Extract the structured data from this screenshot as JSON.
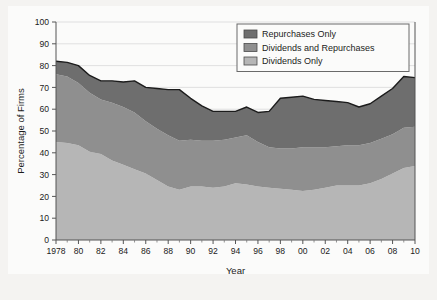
{
  "figure": {
    "background_color": "#fbfbfa",
    "page_background_color": "#f4f3f1"
  },
  "chart_data": {
    "type": "area",
    "stacked": true,
    "title": "",
    "xlabel": "Year",
    "ylabel": "Percentage of Firms",
    "xlim": [
      1978,
      2010
    ],
    "ylim": [
      0,
      100
    ],
    "ytick_step": 10,
    "xtick_step": 2,
    "grid": "horizontal",
    "legend_position": "top-right",
    "yticks": [
      "0",
      "10",
      "20",
      "30",
      "40",
      "50",
      "60",
      "70",
      "80",
      "90",
      "100"
    ],
    "xticks": [
      "1978",
      "80",
      "82",
      "84",
      "86",
      "88",
      "90",
      "92",
      "94",
      "96",
      "98",
      "00",
      "02",
      "04",
      "06",
      "08",
      "10"
    ],
    "x": [
      1978,
      1979,
      1980,
      1981,
      1982,
      1983,
      1984,
      1985,
      1986,
      1987,
      1988,
      1989,
      1990,
      1991,
      1992,
      1993,
      1994,
      1995,
      1996,
      1997,
      1998,
      1999,
      2000,
      2001,
      2002,
      2003,
      2004,
      2005,
      2006,
      2007,
      2008,
      2009,
      2010
    ],
    "series": [
      {
        "name": "Dividends Only",
        "color": "#b6b6b6",
        "values": [
          45.0,
          44.5,
          43.5,
          40.5,
          39.5,
          36.5,
          34.5,
          32.5,
          30.5,
          27.5,
          24.5,
          23.0,
          24.5,
          24.5,
          24.0,
          24.5,
          26.0,
          25.5,
          24.5,
          24.0,
          23.5,
          23.0,
          22.5,
          23.0,
          24.0,
          25.0,
          25.0,
          25.0,
          26.0,
          28.0,
          30.5,
          33.0,
          34.0
        ]
      },
      {
        "name": "Dividends and Repurchases",
        "color": "#8f8f8f",
        "values": [
          31.0,
          30.5,
          28.5,
          27.0,
          25.0,
          26.5,
          26.5,
          26.0,
          24.0,
          23.5,
          23.5,
          22.5,
          21.5,
          21.0,
          21.5,
          21.5,
          21.0,
          22.5,
          20.5,
          18.5,
          18.5,
          19.0,
          20.0,
          19.5,
          18.5,
          18.0,
          18.5,
          18.5,
          18.5,
          18.5,
          18.0,
          18.5,
          18.0
        ]
      },
      {
        "name": "Repurchases Only",
        "color": "#6e6e6e",
        "values": [
          6.0,
          6.5,
          8.0,
          8.0,
          8.5,
          10.0,
          11.5,
          14.5,
          15.5,
          18.5,
          21.0,
          23.5,
          19.0,
          16.0,
          13.5,
          13.0,
          12.0,
          13.0,
          13.5,
          16.5,
          23.0,
          23.5,
          23.5,
          22.0,
          21.5,
          20.5,
          19.5,
          17.5,
          18.0,
          19.5,
          21.0,
          23.5,
          22.5
        ]
      }
    ],
    "totals": [
      82.0,
      81.5,
      80.0,
      75.5,
      73.0,
      73.0,
      72.5,
      73.0,
      70.0,
      69.5,
      69.0,
      69.0,
      65.0,
      61.5,
      59.0,
      59.0,
      59.0,
      61.0,
      58.5,
      59.0,
      65.0,
      65.5,
      66.0,
      64.5,
      64.0,
      63.5,
      63.0,
      61.0,
      62.5,
      66.0,
      69.5,
      75.0,
      74.5
    ]
  },
  "legend": {
    "items": [
      {
        "label": "Repurchases Only",
        "color": "#6e6e6e"
      },
      {
        "label": "Dividends and Repurchases",
        "color": "#8f8f8f"
      },
      {
        "label": "Dividends Only",
        "color": "#b6b6b6"
      }
    ]
  }
}
